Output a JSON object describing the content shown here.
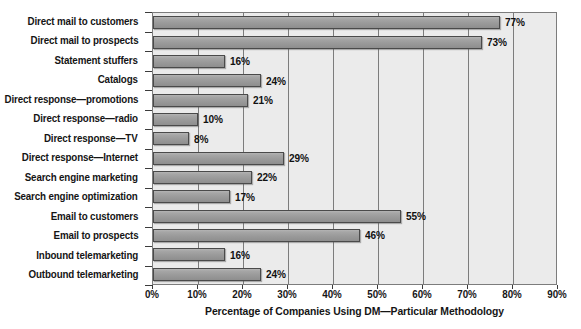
{
  "chart_data": {
    "type": "bar",
    "orientation": "horizontal",
    "title": "",
    "xlabel": "Percentage of Companies Using DM—Particular Methodology",
    "ylabel": "",
    "xlim": [
      0,
      90
    ],
    "grid": true,
    "legend": "none",
    "xticks": [
      "0%",
      "10%",
      "20%",
      "30%",
      "40%",
      "50%",
      "60%",
      "70%",
      "80%",
      "90%"
    ],
    "xtick_values": [
      0,
      10,
      20,
      30,
      40,
      50,
      60,
      70,
      80,
      90
    ],
    "categories": [
      "Direct mail to customers",
      "Direct mail to prospects",
      "Statement stuffers",
      "Catalogs",
      "Direct response—promotions",
      "Direct response—radio",
      "Direct response—TV",
      "Direct response—Internet",
      "Search engine marketing",
      "Search engine optimization",
      "Email to customers",
      "Email to prospects",
      "Inbound telemarketing",
      "Outbound telemarketing"
    ],
    "values": [
      77,
      73,
      16,
      24,
      21,
      10,
      8,
      29,
      22,
      17,
      55,
      46,
      16,
      24
    ],
    "data_labels": [
      "77%",
      "73%",
      "16%",
      "24%",
      "21%",
      "10%",
      "8%",
      "29%",
      "22%",
      "17%",
      "55%",
      "46%",
      "16%",
      "24%"
    ],
    "colors": {
      "bar_fill": "#9a9a9a",
      "bar_border": "#4a4a4a",
      "plot_background": "#ebebeb",
      "gridline": "#7c7c7c",
      "text": "#151515",
      "page_background": "#ffffff"
    }
  }
}
